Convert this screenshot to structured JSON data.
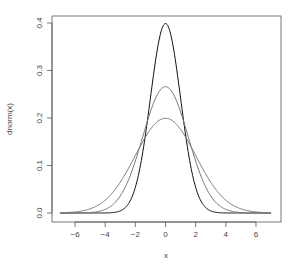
{
  "chart_data": {
    "type": "line",
    "title": "",
    "xlabel": "x",
    "ylabel": "dnorm(x)",
    "xlim": [
      -7,
      7
    ],
    "ylim": [
      0,
      0.4
    ],
    "grid": false,
    "legend": null,
    "x_ticks": [
      -6,
      -4,
      -2,
      0,
      2,
      4,
      6
    ],
    "y_ticks": [
      0.0,
      0.1,
      0.2,
      0.3,
      0.4
    ],
    "x_tick_labels": [
      "−6",
      "−4",
      "−2",
      "0",
      "2",
      "4",
      "6"
    ],
    "y_tick_labels": [
      "0.0",
      "0.1",
      "0.2",
      "0.3",
      "0.4"
    ],
    "series": [
      {
        "name": "sd=1",
        "color": "#111111",
        "sd": 1,
        "peak": 0.399,
        "x": [
          -7,
          -6,
          -5,
          -4,
          -3,
          -2.5,
          -2,
          -1.5,
          -1,
          -0.5,
          0,
          0.5,
          1,
          1.5,
          2,
          2.5,
          3,
          4,
          5,
          6,
          7
        ],
        "values": [
          0,
          0,
          0,
          0.0001,
          0.0044,
          0.0175,
          0.054,
          0.1295,
          0.242,
          0.3521,
          0.3989,
          0.3521,
          0.242,
          0.1295,
          0.054,
          0.0175,
          0.0044,
          0.0001,
          0,
          0,
          0
        ]
      },
      {
        "name": "sd=1.5",
        "color": "#777777",
        "sd": 1.5,
        "peak": 0.266,
        "x": [
          -7,
          -6,
          -5,
          -4,
          -3,
          -2,
          -1,
          0,
          1,
          2,
          3,
          4,
          5,
          6,
          7
        ],
        "values": [
          0.0,
          0.0001,
          0.001,
          0.0076,
          0.036,
          0.1093,
          0.213,
          0.266,
          0.213,
          0.1093,
          0.036,
          0.0076,
          0.001,
          0.0001,
          0.0
        ]
      },
      {
        "name": "sd=2",
        "color": "#777777",
        "sd": 2,
        "peak": 0.199,
        "x": [
          -7,
          -6,
          -5,
          -4,
          -3,
          -2,
          -1,
          0,
          1,
          2,
          3,
          4,
          5,
          6,
          7
        ],
        "values": [
          0.0004,
          0.0022,
          0.0088,
          0.027,
          0.0648,
          0.121,
          0.176,
          0.1995,
          0.176,
          0.121,
          0.0648,
          0.027,
          0.0088,
          0.0022,
          0.0004
        ]
      }
    ]
  },
  "layout": {
    "box": {
      "left": 52,
      "top": 16,
      "right": 281,
      "bottom": 222
    },
    "x0_px": 165.5,
    "x_px_per_unit": 15.08,
    "y0_px": 213,
    "y_px_per_unit": 475
  }
}
